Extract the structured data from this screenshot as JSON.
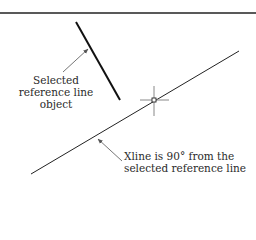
{
  "diagram": {
    "labels": {
      "reference_line": [
        "Selected",
        "reference line",
        "object"
      ],
      "xline": [
        "Xline is 90° from the",
        "selected reference line"
      ]
    },
    "colors": {
      "line": "#111111",
      "arrow": "#666666",
      "crosshair": "#888888",
      "text": "#2a2a2a"
    },
    "xline_angle_deg": 90
  }
}
